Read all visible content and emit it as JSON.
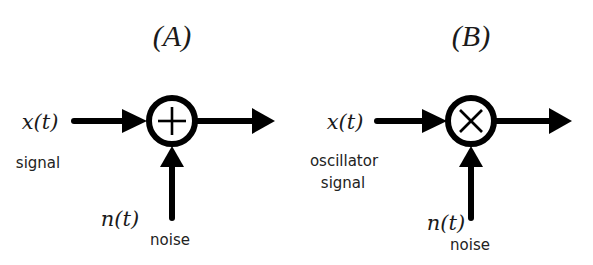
{
  "colors": {
    "stroke": "#000000",
    "text": "#1a1a1a",
    "background": "#ffffff"
  },
  "panels": [
    {
      "id": "A",
      "title": "(A)",
      "operator": "adder",
      "operator_icon": "plus-icon",
      "input_symbol": "x(t)",
      "input_label": [
        "signal"
      ],
      "noise_symbol": "n(t)",
      "noise_label": "noise"
    },
    {
      "id": "B",
      "title": "(B)",
      "operator": "multiplier",
      "operator_icon": "times-icon",
      "input_symbol": "x(t)",
      "input_label": [
        "oscillator",
        "signal"
      ],
      "noise_symbol": "n(t)",
      "noise_label": "noise"
    }
  ]
}
